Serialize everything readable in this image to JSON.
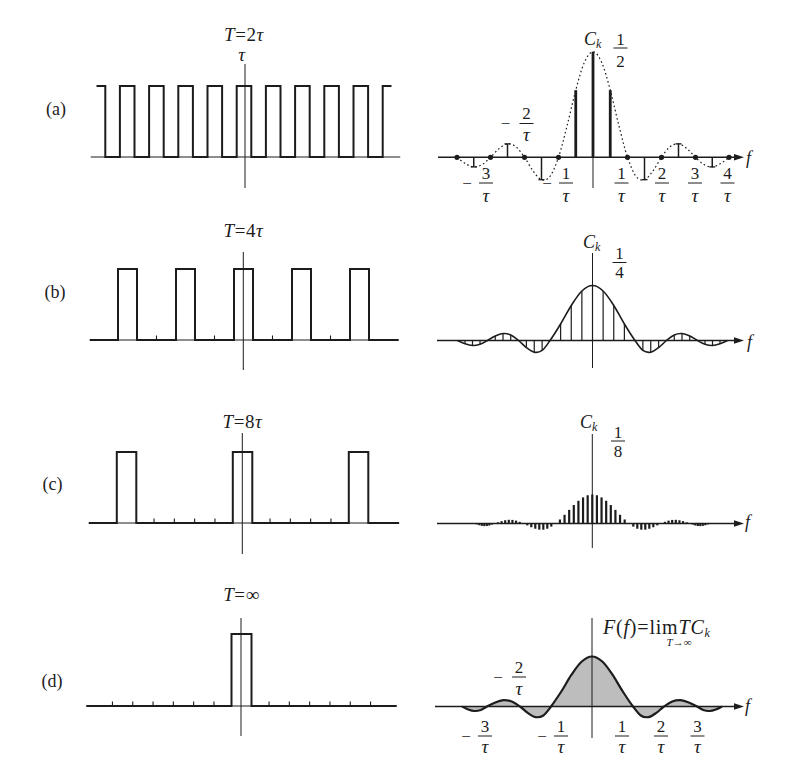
{
  "figure": {
    "panel_labels": [
      "(a)",
      "(b)",
      "(c)",
      "(d)"
    ]
  },
  "chart_data": [
    {
      "panel": "(a)",
      "type": "line",
      "kind": "time-domain rectangular pulse train",
      "title_parts": [
        {
          "t": "T",
          "italic": true
        },
        {
          "t": "=2",
          "italic": false
        },
        {
          "t": "τ",
          "italic": true
        }
      ],
      "annotation": "τ",
      "xlabel": "t",
      "x_unit": "τ",
      "ylabel": "",
      "amplitude": 1,
      "pulse_width": 1,
      "period": 2,
      "pulse_centers": [
        -10,
        -8,
        -6,
        -4,
        -2,
        0,
        2,
        4,
        6,
        8,
        10
      ],
      "signal_range": [
        -10.1,
        10.1
      ],
      "axis_range": [
        -10.5,
        10.7
      ],
      "ticks": []
    },
    {
      "panel": "(a)",
      "type": "bar",
      "kind": "line spectrum",
      "ylabel_parts": {
        "main": "C",
        "sub": "k"
      },
      "peak_label": {
        "num": "1",
        "den": "2"
      },
      "xlabel": "f",
      "x_unit": "1/τ",
      "harmonic_spacing": 0.5,
      "f": [
        -4,
        -3.5,
        -3,
        -2.5,
        -2,
        -1.5,
        -1,
        -0.5,
        0,
        0.5,
        1,
        1.5,
        2,
        2.5,
        3,
        3.5,
        4
      ],
      "values": [
        0,
        -0.0455,
        0,
        0.0637,
        0,
        -0.1061,
        0,
        0.3183,
        0.5,
        0.3183,
        0,
        -0.1061,
        0,
        0.0637,
        0,
        -0.0455,
        0
      ],
      "zero_markers": [
        -4,
        -3,
        -2,
        -1,
        1,
        2,
        3,
        4
      ],
      "envelope": {
        "style": "dashed",
        "f": [
          -4,
          -3.75,
          -3.5,
          -3.25,
          -3,
          -2.75,
          -2.5,
          -2.25,
          -2,
          -1.75,
          -1.5,
          -1.25,
          -1,
          -0.75,
          -0.5,
          -0.25,
          0,
          0.25,
          0.5,
          0.75,
          1,
          1.25,
          1.5,
          1.75,
          2,
          2.25,
          2.5,
          2.75,
          3,
          3.25,
          3.5,
          3.75,
          4
        ],
        "values": [
          0,
          -0.03,
          -0.0455,
          -0.0347,
          0,
          0.0409,
          0.0637,
          0.05,
          0,
          -0.0643,
          -0.1061,
          -0.0901,
          0,
          0.1501,
          0.3183,
          0.4502,
          0.5,
          0.4502,
          0.3183,
          0.1501,
          0,
          -0.0901,
          -0.1061,
          -0.0643,
          0,
          0.05,
          0.0637,
          0.0409,
          0,
          -0.0347,
          -0.0455,
          -0.03,
          0
        ]
      },
      "tick_labels": [
        {
          "sign": "−",
          "num": "3",
          "den": "τ",
          "f": -3,
          "position": "below"
        },
        {
          "sign": "−",
          "num": "2",
          "den": "τ",
          "f": -2,
          "position": "above"
        },
        {
          "sign": "−",
          "num": "1",
          "den": "τ",
          "f": -1,
          "position": "below"
        },
        {
          "sign": "",
          "num": "1",
          "den": "τ",
          "f": 1,
          "position": "below"
        },
        {
          "sign": "",
          "num": "2",
          "den": "τ",
          "f": 2,
          "position": "below"
        },
        {
          "sign": "",
          "num": "3",
          "den": "τ",
          "f": 3,
          "position": "below"
        },
        {
          "sign": "",
          "num": "4",
          "den": "τ",
          "f": 4,
          "position": "below"
        }
      ]
    },
    {
      "panel": "(b)",
      "type": "line",
      "kind": "time-domain rectangular pulse train",
      "title_parts": [
        {
          "t": "T",
          "italic": true
        },
        {
          "t": "=4",
          "italic": false
        },
        {
          "t": "τ",
          "italic": true
        }
      ],
      "xlabel": "t",
      "x_unit": "τ",
      "ylabel": "",
      "amplitude": 1,
      "pulse_width": 1,
      "period": 4,
      "pulse_centers": [
        -8,
        -4,
        0,
        4,
        8
      ],
      "signal_range": [
        -10.6,
        10.7
      ],
      "axis_range": [
        -10.6,
        10.7
      ],
      "ticks": [
        -6,
        -2,
        2,
        6
      ]
    },
    {
      "panel": "(b)",
      "type": "bar",
      "kind": "line spectrum",
      "ylabel_parts": {
        "main": "C",
        "sub": "k"
      },
      "peak_label": {
        "num": "1",
        "den": "4"
      },
      "xlabel": "f",
      "x_unit": "1/τ",
      "harmonic_spacing": 0.25,
      "envelope_style": "solid",
      "f": [
        -4,
        -3.75,
        -3.5,
        -3.25,
        -3,
        -2.75,
        -2.5,
        -2.25,
        -2,
        -1.75,
        -1.5,
        -1.25,
        -1,
        -0.75,
        -0.5,
        -0.25,
        0,
        0.25,
        0.5,
        0.75,
        1,
        1.25,
        1.5,
        1.75,
        2,
        2.25,
        2.5,
        2.75,
        3,
        3.25,
        3.5,
        3.75,
        4
      ],
      "values": [
        0,
        -0.015,
        -0.0227,
        -0.0173,
        0,
        0.0205,
        0.0318,
        0.025,
        0,
        -0.0322,
        -0.0531,
        -0.045,
        0,
        0.075,
        0.1592,
        0.2251,
        0.25,
        0.2251,
        0.1592,
        0.075,
        0,
        -0.045,
        -0.0531,
        -0.0322,
        0,
        0.025,
        0.0318,
        0.0205,
        0,
        -0.0173,
        -0.0227,
        -0.015,
        0
      ],
      "tick_labels": []
    },
    {
      "panel": "(c)",
      "type": "line",
      "kind": "time-domain rectangular pulse train",
      "title_parts": [
        {
          "t": "T",
          "italic": true
        },
        {
          "t": "=8",
          "italic": false
        },
        {
          "t": "τ",
          "italic": true
        }
      ],
      "xlabel": "t",
      "x_unit": "τ",
      "ylabel": "",
      "amplitude": 1,
      "pulse_width": 1,
      "period": 8,
      "pulse_centers": [
        -8,
        0,
        8
      ],
      "signal_range": [
        -10.6,
        10.8
      ],
      "axis_range": [
        -10.6,
        10.8
      ],
      "ticks": [
        -6.1,
        -4.7,
        -3.3,
        -1.9,
        1.9,
        3.3,
        4.7,
        6.1
      ]
    },
    {
      "panel": "(c)",
      "type": "bar",
      "kind": "line spectrum",
      "ylabel_parts": {
        "main": "C",
        "sub": "k"
      },
      "peak_label": {
        "num": "1",
        "den": "8"
      },
      "xlabel": "f",
      "x_unit": "1/τ",
      "harmonic_spacing": 0.125,
      "f": [
        -4,
        -3.875,
        -3.75,
        -3.625,
        -3.5,
        -3.375,
        -3.25,
        -3.125,
        -3,
        -2.875,
        -2.75,
        -2.625,
        -2.5,
        -2.375,
        -2.25,
        -2.125,
        -2,
        -1.875,
        -1.75,
        -1.625,
        -1.5,
        -1.375,
        -1.25,
        -1.125,
        -1,
        -0.875,
        -0.75,
        -0.625,
        -0.5,
        -0.375,
        -0.25,
        -0.125,
        0,
        0.125,
        0.25,
        0.375,
        0.5,
        0.625,
        0.75,
        0.875,
        1,
        1.125,
        1.25,
        1.375,
        1.5,
        1.625,
        1.75,
        1.875,
        2,
        2.125,
        2.25,
        2.375,
        2.5,
        2.625,
        2.75,
        2.875,
        3,
        3.125,
        3.25,
        3.375,
        3.5,
        3.625,
        3.75,
        3.875,
        4
      ],
      "values": [
        0,
        -0.0039,
        -0.0075,
        -0.0101,
        -0.0114,
        -0.0109,
        -0.0087,
        -0.0049,
        0,
        0.0053,
        0.0102,
        0.014,
        0.0159,
        0.0155,
        0.0125,
        0.0072,
        0,
        -0.0081,
        -0.0161,
        -0.0226,
        -0.0265,
        -0.0267,
        -0.0225,
        -0.0135,
        0,
        0.0174,
        0.0375,
        0.0588,
        0.0796,
        0.098,
        0.1125,
        0.1218,
        0.125,
        0.1218,
        0.1125,
        0.098,
        0.0796,
        0.0588,
        0.0375,
        0.0174,
        0,
        -0.0135,
        -0.0225,
        -0.0267,
        -0.0265,
        -0.0226,
        -0.0161,
        -0.0081,
        0,
        0.0072,
        0.0125,
        0.0155,
        0.0159,
        0.014,
        0.0102,
        0.0053,
        0,
        -0.0049,
        -0.0087,
        -0.0109,
        -0.0114,
        -0.0101,
        -0.0075,
        -0.0039,
        0
      ],
      "tick_labels": []
    },
    {
      "panel": "(d)",
      "type": "line",
      "kind": "time-domain single rectangular pulse",
      "title_parts": [
        {
          "t": "T",
          "italic": true
        },
        {
          "t": "=∞",
          "italic": false
        }
      ],
      "xlabel": "t",
      "x_unit": "τ",
      "ylabel": "",
      "amplitude": 1,
      "pulse_width": 1,
      "period": "∞",
      "pulse_centers": [
        0
      ],
      "signal_range": [
        -10.7,
        10.7
      ],
      "axis_range": [
        -10.7,
        10.7
      ],
      "ticks": [
        -8.9,
        -7.5,
        -6.1,
        -4.7,
        -3.3,
        -1.9,
        1.9,
        3.3,
        4.7,
        6.1,
        7.5,
        8.9
      ]
    },
    {
      "panel": "(d)",
      "type": "area",
      "kind": "continuous spectrum (shaded)",
      "ylabel_parts": [
        {
          "t": "F",
          "italic": true
        },
        {
          "t": "(",
          "italic": false
        },
        {
          "t": "f",
          "italic": true
        },
        {
          "t": ")=lim",
          "italic": false
        },
        {
          "t": "TC",
          "italic": true
        }
      ],
      "ylabel_sub": "k",
      "ylabel_limit": "T→∞",
      "xlabel": "f",
      "x_unit": "1/τ",
      "f": [
        -4,
        -3.75,
        -3.5,
        -3.25,
        -3,
        -2.75,
        -2.5,
        -2.25,
        -2,
        -1.75,
        -1.5,
        -1.25,
        -1,
        -0.75,
        -0.5,
        -0.25,
        0,
        0.25,
        0.5,
        0.75,
        1,
        1.25,
        1.5,
        1.75,
        2,
        2.25,
        2.5,
        2.75,
        3,
        3.25,
        3.5,
        3.75,
        4
      ],
      "values": [
        0,
        -0.06,
        -0.0909,
        -0.0693,
        0,
        0.0818,
        0.1273,
        0.1,
        0,
        -0.1286,
        -0.2122,
        -0.1801,
        0,
        0.3001,
        0.6366,
        0.9003,
        1,
        0.9003,
        0.6366,
        0.3001,
        0,
        -0.1801,
        -0.2122,
        -0.1286,
        0,
        0.1,
        0.1273,
        0.0818,
        0,
        -0.0693,
        -0.0909,
        -0.06,
        0
      ],
      "fill_color": "#bdbdbd",
      "tick_labels": [
        {
          "sign": "−",
          "num": "3",
          "den": "τ",
          "f": -3,
          "position": "below"
        },
        {
          "sign": "−",
          "num": "2",
          "den": "τ",
          "f": -2,
          "position": "above"
        },
        {
          "sign": "−",
          "num": "1",
          "den": "τ",
          "f": -1,
          "position": "below"
        },
        {
          "sign": "",
          "num": "1",
          "den": "τ",
          "f": 1,
          "position": "below"
        },
        {
          "sign": "",
          "num": "2",
          "den": "τ",
          "f": 2,
          "position": "below"
        },
        {
          "sign": "",
          "num": "3",
          "den": "τ",
          "f": 3,
          "position": "below"
        }
      ]
    }
  ]
}
